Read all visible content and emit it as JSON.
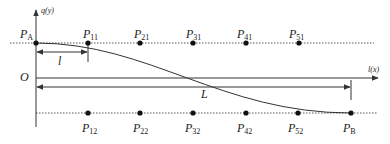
{
  "diagram": {
    "colors": {
      "line": "#333333",
      "dotted": "#555555",
      "point": "#111111"
    },
    "axes": {
      "vertical_label": "q(y)",
      "horizontal_label": "l(x)",
      "origin_label": "O"
    },
    "dimensions": {
      "short_span_label": "l",
      "long_span_label": "L"
    },
    "top_row_points": [
      {
        "base": "P",
        "sub": "A"
      },
      {
        "base": "P",
        "sub": "11"
      },
      {
        "base": "P",
        "sub": "21"
      },
      {
        "base": "P",
        "sub": "31"
      },
      {
        "base": "P",
        "sub": "41"
      },
      {
        "base": "P",
        "sub": "51"
      }
    ],
    "bottom_row_points": [
      {
        "base": "P",
        "sub": "12"
      },
      {
        "base": "P",
        "sub": "22"
      },
      {
        "base": "P",
        "sub": "32"
      },
      {
        "base": "P",
        "sub": "42"
      },
      {
        "base": "P",
        "sub": "52"
      },
      {
        "base": "P",
        "sub": "B"
      }
    ]
  }
}
